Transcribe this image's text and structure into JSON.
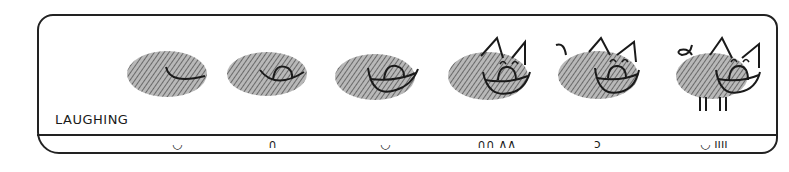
{
  "caption": "LAUGHING",
  "colors": {
    "ink": "#1a1a1a",
    "thumbprint": "#8a8a8a"
  },
  "figures": [
    {
      "stage": 1,
      "parts": [
        "thumbprint",
        "closed-smile"
      ]
    },
    {
      "stage": 2,
      "parts": [
        "thumbprint",
        "open-smile",
        "tongue"
      ]
    },
    {
      "stage": 3,
      "parts": [
        "thumbprint",
        "wide-open-smile",
        "tongue"
      ]
    },
    {
      "stage": 4,
      "parts": [
        "thumbprint",
        "wide-open-smile",
        "tongue",
        "closed-eyes",
        "ears"
      ]
    },
    {
      "stage": 5,
      "parts": [
        "thumbprint",
        "wide-open-smile",
        "tongue",
        "closed-eyes",
        "ears",
        "tail"
      ]
    },
    {
      "stage": 6,
      "parts": [
        "thumbprint",
        "wide-open-smile",
        "tongue",
        "closed-eyes",
        "ears",
        "curly-tail",
        "legs"
      ]
    }
  ],
  "symbols": [
    {
      "x": 172,
      "text": "◡"
    },
    {
      "x": 268,
      "text": "∩"
    },
    {
      "x": 380,
      "text": "◡"
    },
    {
      "x": 477,
      "text": "∩∩ ∧∧"
    },
    {
      "x": 594,
      "text": "ↄ"
    },
    {
      "x": 700,
      "text": "◡ ıııı"
    }
  ]
}
